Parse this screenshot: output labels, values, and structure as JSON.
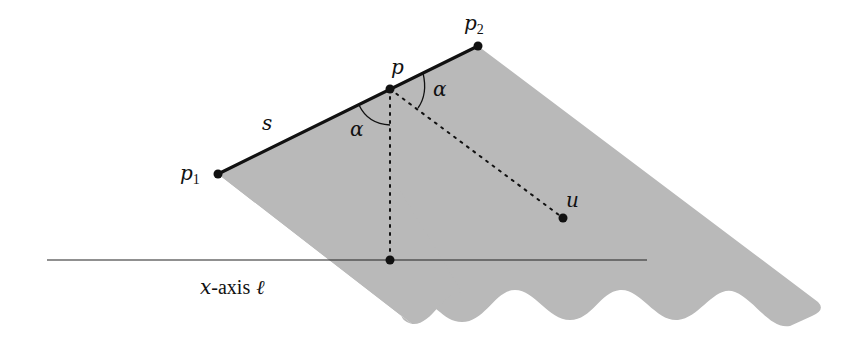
{
  "figure": {
    "colors": {
      "region_fill": "#b9b9b9",
      "stroke": "#111111",
      "background": "#ffffff"
    },
    "points": {
      "p1": {
        "label": "p",
        "sub": "1",
        "x": 218,
        "y": 174
      },
      "p": {
        "label": "p",
        "x": 390,
        "y": 89
      },
      "p2": {
        "label": "p",
        "sub": "2",
        "x": 478,
        "y": 46
      },
      "u": {
        "label": "u",
        "x": 563,
        "y": 218
      },
      "foot": {
        "x": 390,
        "y": 260
      }
    },
    "segment_label": "s",
    "angle_label_left": "α",
    "angle_label_right": "α",
    "axis": {
      "var": "x",
      "text": "-axis",
      "ell": "ℓ"
    }
  }
}
